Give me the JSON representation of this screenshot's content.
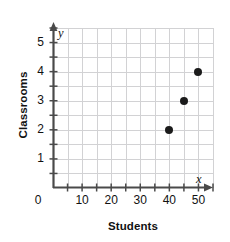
{
  "chart_data": {
    "type": "scatter",
    "title": "",
    "xlabel": "Students",
    "ylabel": "Classrooms",
    "x_axis_var": "x",
    "y_axis_var": "y",
    "xlim": [
      0,
      55
    ],
    "ylim": [
      0,
      5.5
    ],
    "x_major_ticks": [
      10,
      20,
      30,
      40,
      50
    ],
    "x_minor_tick_step": 5,
    "y_major_ticks": [
      1,
      2,
      3,
      4,
      5
    ],
    "y_minor_tick_step": 0.5,
    "origin_label": "0",
    "grid": true,
    "grid_color": "#d2d2d4",
    "axis_color": "#4a4a4a",
    "point_color": "#1b1b1b",
    "legend": null,
    "points": [
      {
        "label": "point-1",
        "x": 40,
        "y": 2
      },
      {
        "label": "point-2",
        "x": 45,
        "y": 3
      },
      {
        "label": "point-3",
        "x": 50,
        "y": 4
      }
    ]
  }
}
